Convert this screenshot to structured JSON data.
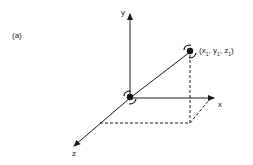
{
  "figure": {
    "panel_label": "(a)",
    "axes": {
      "x": "x",
      "y": "y",
      "z": "z"
    },
    "point_label": {
      "x": "x",
      "y": "y",
      "z": "z",
      "sub": "1"
    },
    "colors": {
      "line": "#1a1a1a",
      "background": "#ffffff"
    }
  }
}
